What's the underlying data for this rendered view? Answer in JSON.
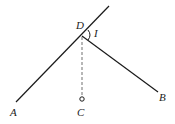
{
  "diagram": {
    "labels": {
      "D": "D",
      "I": "I",
      "A": "A",
      "B": "B",
      "C": "C"
    },
    "colors": {
      "line": "#1a1a1a",
      "dashed": "#888888",
      "background": "#ffffff"
    }
  }
}
